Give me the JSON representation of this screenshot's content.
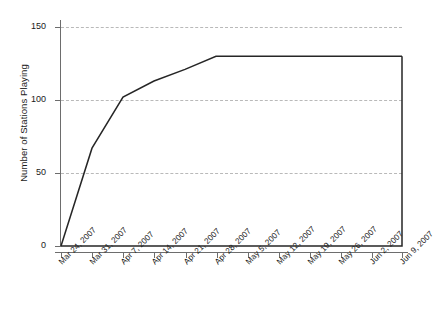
{
  "chart_data": {
    "type": "line",
    "title": "",
    "xlabel": "",
    "ylabel": "Number of Stations Playing",
    "ylim": [
      0,
      150
    ],
    "yticks": [
      0,
      50,
      100,
      150
    ],
    "ytick_labels": [
      "0",
      "50",
      "100",
      "150"
    ],
    "grid": true,
    "gridlines": "horizontal-dashed",
    "legend": "none",
    "categories": [
      "Mar 24, 2007",
      "Mar 31, 2007",
      "Apr 7, 2007",
      "Apr 14, 2007",
      "Apr 21, 2007",
      "Apr 28, 2007",
      "May 5, 2007",
      "May 12, 2007",
      "May 19, 2007",
      "May 26, 2007",
      "Jun 2, 2007",
      "Jun 9, 2007"
    ],
    "values": [
      0,
      67,
      102,
      113,
      121,
      130,
      130,
      130,
      130,
      130,
      130,
      130
    ],
    "series": [
      {
        "name": "Number of Stations Playing",
        "color": "#262626",
        "values": [
          0,
          67,
          102,
          113,
          121,
          130,
          130,
          130,
          130,
          130,
          130,
          130
        ]
      }
    ],
    "baseline_segment": {
      "description": "horizontal line along y=0 from first to last category, with vertical closing segment at last category",
      "value": 0
    },
    "colors": {
      "line": "#262626",
      "axis": "#6d6d6d",
      "grid": "#b9b9b9",
      "text": "#1a1a1a",
      "background": "#ffffff"
    }
  }
}
